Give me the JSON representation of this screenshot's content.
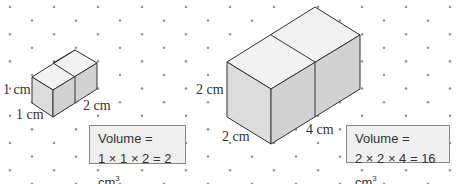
{
  "diagram": {
    "type": "isometric cuboid volume diagram on dot grid",
    "small_cuboid": {
      "labels": {
        "height": "1 cm",
        "width": "1 cm",
        "length": "2 cm"
      },
      "volume_box": {
        "line1": "Volume =",
        "line2": "1 × 1 × 2 = 2 cm",
        "unit_exp": "3"
      }
    },
    "large_cuboid": {
      "labels": {
        "height": "2 cm",
        "width": "2 cm",
        "length": "4 cm"
      },
      "volume_box": {
        "line1": "Volume =",
        "line2": "2 × 2 × 4 = 16 cm",
        "unit_exp": "3"
      }
    },
    "colors": {
      "top_face": "#f2f2f2",
      "left_face": "#dcdcdc",
      "right_face": "#d0d0d0",
      "edge": "#333333",
      "dot": "#999999"
    }
  }
}
